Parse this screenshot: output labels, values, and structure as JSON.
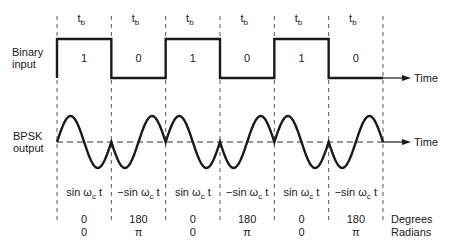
{
  "diagram": {
    "bit_period_label": "t",
    "bit_period_subscript": "b",
    "binary_input_label": [
      "Binary",
      "input"
    ],
    "bpsk_output_label": [
      "BPSK",
      "output"
    ],
    "time_axis_label": "Time",
    "bits": [
      1,
      0,
      1,
      0,
      1,
      0
    ],
    "signal_expressions": [
      {
        "sign": "",
        "text": "sin ω",
        "sub": "c",
        "tail": "t"
      },
      {
        "sign": "−",
        "text": "sin ω",
        "sub": "c",
        "tail": "t"
      },
      {
        "sign": "",
        "text": "sin ω",
        "sub": "c",
        "tail": "t"
      },
      {
        "sign": "−",
        "text": "sin ω",
        "sub": "c",
        "tail": "t"
      },
      {
        "sign": "",
        "text": "sin ω",
        "sub": "c",
        "tail": "t"
      },
      {
        "sign": "−",
        "text": "sin ω",
        "sub": "c",
        "tail": "t"
      }
    ],
    "phase_degrees": [
      "0",
      "180",
      "0",
      "180",
      "0",
      "180"
    ],
    "phase_radians": [
      "0",
      "π",
      "0",
      "π",
      "0",
      "π"
    ],
    "degrees_label": "Degrees",
    "radians_label": "Radians",
    "carrier_cycles_per_bit": 1
  }
}
